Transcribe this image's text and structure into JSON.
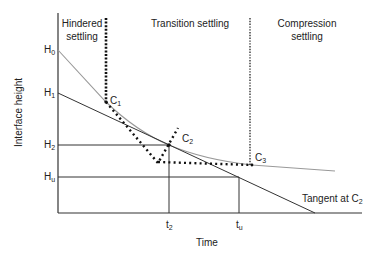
{
  "diagram": {
    "type": "settling-curve",
    "regions": [
      {
        "line1": "Hindered",
        "line2": "settling"
      },
      {
        "line1": "Transition settling",
        "line2": ""
      },
      {
        "line1": "Compression",
        "line2": "settling"
      }
    ],
    "axes": {
      "ylabel": "Interface height",
      "xlabel": "Time"
    },
    "y_ticks": [
      {
        "base": "H",
        "sub": "0"
      },
      {
        "base": "H",
        "sub": "1"
      },
      {
        "base": "H",
        "sub": "2"
      },
      {
        "base": "H",
        "sub": "u"
      }
    ],
    "x_ticks": [
      {
        "base": "t",
        "sub": "2"
      },
      {
        "base": "t",
        "sub": "u"
      }
    ],
    "points": [
      {
        "base": "C",
        "sub": "1"
      },
      {
        "base": "C",
        "sub": "2"
      },
      {
        "base": "C",
        "sub": "3"
      }
    ],
    "tangent_label": {
      "text": "Tangent at C",
      "sub": "2"
    },
    "colors": {
      "axis": "#333333",
      "curve": "#888888",
      "tangent": "#333333",
      "dotted": "#111111"
    }
  }
}
